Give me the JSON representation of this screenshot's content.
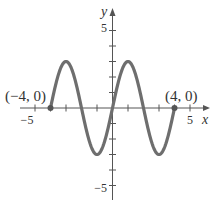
{
  "chart_data": {
    "type": "line",
    "title": "",
    "xlabel": "x",
    "ylabel": "y",
    "xlim": [
      -5.5,
      6.2
    ],
    "ylim": [
      -6,
      7
    ],
    "x_ticks": [
      -5,
      -4,
      -3,
      -2,
      -1,
      1,
      2,
      3,
      4,
      5
    ],
    "x_tick_labels": {
      "-5": "−5",
      "5": "5"
    },
    "y_ticks": [
      -5,
      -4,
      -3,
      -2,
      -1,
      1,
      2,
      3,
      4,
      5
    ],
    "y_tick_labels": {
      "-5": "−5",
      "5": "5"
    },
    "grid": false,
    "function": "y = 3 sin(πx/2)",
    "domain": [
      -4,
      4
    ],
    "series": [
      {
        "name": "curve",
        "color": "#6e6e6e",
        "x": [
          -4,
          -3,
          -2,
          -1,
          0,
          1,
          2,
          3,
          4
        ],
        "values": [
          0,
          3,
          0,
          -3,
          0,
          3,
          0,
          -3,
          0
        ]
      }
    ],
    "points": [
      {
        "x": -4,
        "y": 0,
        "label": "(−4, 0)"
      },
      {
        "x": 4,
        "y": 0,
        "label": "(4, 0)"
      }
    ]
  },
  "labels": {
    "x_axis": "x",
    "y_axis": "y",
    "x_neg5": "−5",
    "x_pos5": "5",
    "y_pos5": "5",
    "y_neg5": "−5",
    "point_left": "(−4, 0)",
    "point_right": "(4, 0)"
  }
}
